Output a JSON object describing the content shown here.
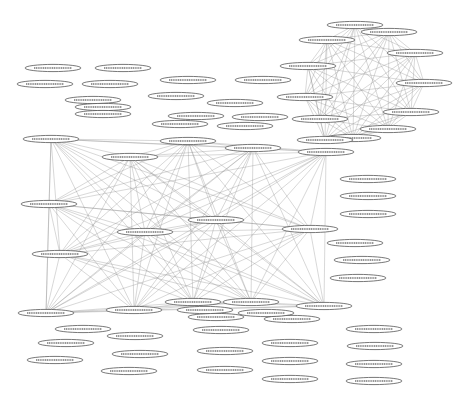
{
  "diagram": {
    "type": "network-graph",
    "node_style": "ellipse",
    "edge_color": "#8a8a8a",
    "node_stroke": "#555555",
    "background": "#ffffff",
    "labels_legible": false,
    "clusters": [
      {
        "name": "clique-top-right",
        "fully_connected": true,
        "nodes": [
          [
            355,
            25
          ],
          [
            389,
            32
          ],
          [
            327,
            40
          ],
          [
            415,
            53
          ],
          [
            308,
            66
          ],
          [
            424,
            83
          ],
          [
            305,
            97
          ],
          [
            411,
            112
          ],
          [
            320,
            119
          ],
          [
            388,
            129
          ],
          [
            353,
            138
          ],
          [
            325,
            140
          ]
        ]
      },
      {
        "name": "mesh-center",
        "fully_connected": true,
        "nodes": [
          [
            51,
            139
          ],
          [
            188,
            141
          ],
          [
            253,
            148
          ],
          [
            326,
            152
          ],
          [
            130,
            157
          ],
          [
            49,
            204
          ],
          [
            216,
            220
          ],
          [
            310,
            229
          ],
          [
            145,
            232
          ],
          [
            60,
            254
          ],
          [
            193,
            302
          ],
          [
            251,
            302
          ],
          [
            134,
            310
          ],
          [
            46,
            313
          ],
          [
            324,
            306
          ]
        ]
      }
    ],
    "isolated_nodes": [
      [
        53,
        68
      ],
      [
        123,
        68
      ],
      [
        45,
        84
      ],
      [
        110,
        84
      ],
      [
        93,
        100
      ],
      [
        103,
        107
      ],
      [
        103,
        114
      ],
      [
        188,
        80
      ],
      [
        263,
        80
      ],
      [
        176,
        96
      ],
      [
        235,
        103
      ],
      [
        196,
        116
      ],
      [
        260,
        117
      ],
      [
        180,
        124
      ],
      [
        245,
        126
      ],
      [
        368,
        179
      ],
      [
        368,
        196
      ],
      [
        368,
        214
      ],
      [
        355,
        243
      ],
      [
        362,
        260
      ],
      [
        358,
        278
      ],
      [
        83,
        329
      ],
      [
        66,
        343
      ],
      [
        55,
        360
      ],
      [
        135,
        336
      ],
      [
        140,
        354
      ],
      [
        129,
        371
      ],
      [
        216,
        317
      ],
      [
        221,
        330
      ],
      [
        225,
        351
      ],
      [
        225,
        370
      ],
      [
        292,
        319
      ],
      [
        290,
        343
      ],
      [
        290,
        361
      ],
      [
        290,
        379
      ],
      [
        374,
        329
      ],
      [
        375,
        346
      ],
      [
        374,
        364
      ],
      [
        374,
        381
      ],
      [
        205,
        310
      ],
      [
        266,
        313
      ]
    ]
  }
}
